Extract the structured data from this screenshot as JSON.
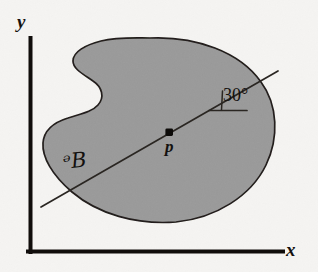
{
  "figure": {
    "caption_domain": "geometry-diagram",
    "background_color": "#f5f4f2",
    "ink_color": "#14110f"
  },
  "axes": {
    "x_label": "x",
    "y_label": "y",
    "color": "#100d0b",
    "origin_px": [
      30,
      252
    ],
    "y_top_px": [
      30,
      38
    ],
    "x_right_px": [
      283,
      252
    ],
    "stroke_width": 4
  },
  "region": {
    "name": "ᵊB",
    "label": "ᵊB",
    "fill_color": "#9a9a9a",
    "outline_color": "#211d1a",
    "label_position_px": [
      72,
      163
    ],
    "bbox_px": [
      42,
      38,
      278,
      222
    ]
  },
  "point": {
    "label": "p",
    "position_px": [
      169,
      132
    ],
    "marker": "filled-square-dot",
    "marker_color": "#0d0b09",
    "label_position_px": [
      172,
      148
    ]
  },
  "line": {
    "name": "axis-through-p",
    "start_px": [
      41,
      207
    ],
    "end_px": [
      278,
      71
    ],
    "color": "#2a2622",
    "stroke_width": 1.6
  },
  "angle": {
    "value": "30°",
    "degrees": 30,
    "vertex_px": [
      222,
      110
    ],
    "reference_line_px": [
      210,
      110,
      246,
      110
    ],
    "tick_px": [
      222,
      92,
      222,
      110
    ],
    "label_position_px": [
      228,
      97
    ]
  }
}
